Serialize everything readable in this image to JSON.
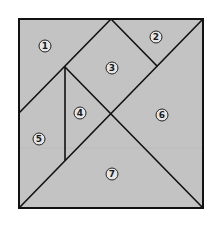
{
  "diagram": {
    "type": "tangram-square",
    "colors": {
      "background": "#ffffff",
      "fill": "#c3c3c3",
      "stroke": "#111111",
      "label_fill": "#e6e6e6",
      "label_stroke": "#222222",
      "faint_line": "#b0b0b0"
    },
    "square": {
      "x1": 19,
      "y1": 19,
      "x2": 203,
      "y2": 208
    },
    "pieces": [
      {
        "id": 1,
        "label": "1",
        "shape": "triangle",
        "points": "19,19 111,19 19,113",
        "label_pos": [
          45,
          46
        ]
      },
      {
        "id": 2,
        "label": "2",
        "shape": "triangle",
        "points": "111,19 203,19 157,66",
        "label_pos": [
          156,
          37
        ]
      },
      {
        "id": 3,
        "label": "3",
        "shape": "square",
        "points": "111,19 157,66 111,113 65,67",
        "label_pos": [
          112,
          68
        ]
      },
      {
        "id": 4,
        "label": "4",
        "shape": "triangle",
        "points": "65,67 111,113 65,160",
        "label_pos": [
          80,
          113
        ]
      },
      {
        "id": 5,
        "label": "5",
        "shape": "parallelogram",
        "points": "19,113 65,67 65,160 19,208",
        "label_pos": [
          39,
          139
        ]
      },
      {
        "id": 6,
        "label": "6",
        "shape": "triangle",
        "points": "203,19 203,208 111,113",
        "label_pos": [
          162,
          115
        ]
      },
      {
        "id": 7,
        "label": "7",
        "shape": "triangle",
        "points": "19,208 111,113 203,208",
        "label_pos": [
          112,
          174
        ]
      }
    ],
    "faint_line_y": 148
  }
}
